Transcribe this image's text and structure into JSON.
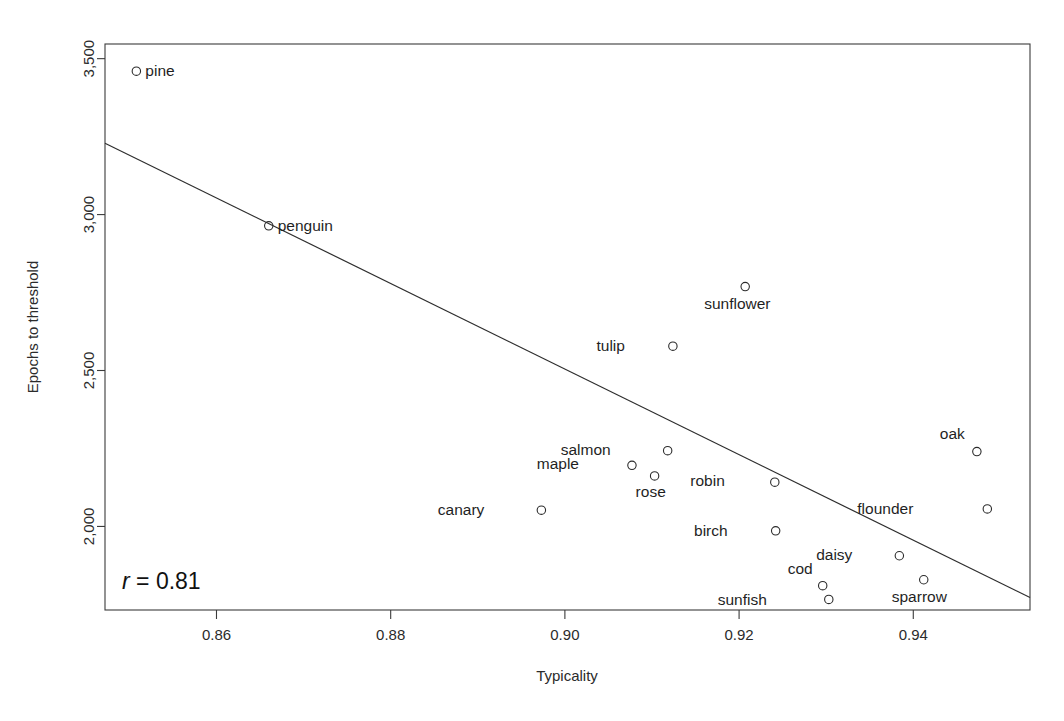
{
  "figure": {
    "background": "#ffffff",
    "marker_color": "#2b2b2b",
    "line_color": "#2e2e2e",
    "axis_color": "#3b3b3b"
  },
  "annotation": {
    "r_symbol": "r",
    "r_text": " = 0.81"
  },
  "chart_data": {
    "type": "scatter",
    "title": "",
    "xlabel": "Typicality",
    "ylabel": "Epochs to threshold",
    "xlim": [
      0.8472,
      0.9534
    ],
    "ylim": [
      1732,
      3547
    ],
    "xticks": [
      0.86,
      0.88,
      0.9,
      0.92,
      0.94
    ],
    "xticklabels": [
      "0.86",
      "0.88",
      "0.90",
      "0.92",
      "0.94"
    ],
    "yticks": [
      2000,
      2500,
      3000,
      3500
    ],
    "yticklabels": [
      "2,000",
      "2,500",
      "3,000",
      "3,500"
    ],
    "grid": false,
    "legend": null,
    "annotations": [
      {
        "text": "r = 0.81",
        "x": 0.8525,
        "y": 1810
      }
    ],
    "trendline": {
      "type": "linear",
      "x": [
        0.8472,
        0.9534
      ],
      "y": [
        3229,
        1772
      ],
      "r": 0.81
    },
    "points": [
      {
        "label": "pine",
        "x": 0.8508,
        "y": 3460,
        "label_dx": 9,
        "label_dy": 5
      },
      {
        "label": "penguin",
        "x": 0.866,
        "y": 2964,
        "label_dx": 9,
        "label_dy": 5
      },
      {
        "label": "sunflower",
        "x": 0.9207,
        "y": 2769,
        "label_dx": -41,
        "label_dy": 22
      },
      {
        "label": "tulip",
        "x": 0.9124,
        "y": 2578,
        "label_dx": -48,
        "label_dy": 5
      },
      {
        "label": "oak",
        "x": 0.9473,
        "y": 2240,
        "label_dx": -12,
        "label_dy": -13
      },
      {
        "label": "salmon",
        "x": 0.9118,
        "y": 2243,
        "label_dx": -57,
        "label_dy": 4
      },
      {
        "label": "maple",
        "x": 0.9077,
        "y": 2196,
        "label_dx": -53,
        "label_dy": 4
      },
      {
        "label": "rose",
        "x": 0.9103,
        "y": 2162,
        "label_dx": -19,
        "label_dy": 21
      },
      {
        "label": "robin",
        "x": 0.9241,
        "y": 2142,
        "label_dx": -50,
        "label_dy": 4
      },
      {
        "label": "flounder",
        "x": 0.9485,
        "y": 2056,
        "label_dx": -74,
        "label_dy": 5
      },
      {
        "label": "canary",
        "x": 0.8973,
        "y": 2052,
        "label_dx": -57,
        "label_dy": 5
      },
      {
        "label": "birch",
        "x": 0.9242,
        "y": 1986,
        "label_dx": -48,
        "label_dy": 5
      },
      {
        "label": "daisy",
        "x": 0.9384,
        "y": 1906,
        "label_dx": -47,
        "label_dy": 4
      },
      {
        "label": "sparrow",
        "x": 0.9412,
        "y": 1829,
        "label_dx": -32,
        "label_dy": 22
      },
      {
        "label": "cod",
        "x": 0.9296,
        "y": 1810,
        "label_dx": -10,
        "label_dy": -12
      },
      {
        "label": "sunfish",
        "x": 0.9303,
        "y": 1766,
        "label_dx": -62,
        "label_dy": 6
      }
    ]
  }
}
